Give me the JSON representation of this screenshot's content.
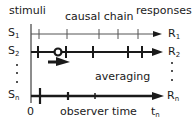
{
  "header": {
    "stimuli_label": "stimuli",
    "chain_label": "causal chain",
    "responses_label": "responses"
  },
  "rows": [
    {
      "stimulus": "S",
      "stimulus_sub": "1",
      "response": "R",
      "response_sub": "1",
      "style": "thin",
      "ticks": [
        39,
        67,
        99,
        118,
        138
      ]
    },
    {
      "stimulus": "S",
      "stimulus_sub": "2",
      "response": "R",
      "response_sub": "2",
      "style": "thick",
      "ticks": [
        38,
        66,
        93,
        128,
        142
      ],
      "circle_x": 58
    },
    {
      "stimulus": "S",
      "stimulus_sub": "n",
      "response": "R",
      "response_sub": "n",
      "style": "thick",
      "ticks": [
        40,
        68,
        95
      ]
    }
  ],
  "annotations": {
    "averaging_label": "averaging",
    "axis_origin_label": "0",
    "axis_label": "observer time",
    "axis_end_label": "t",
    "axis_end_sub": "n"
  },
  "colors": {
    "ink": "#1a1a1a",
    "thin_line": "#555555"
  }
}
